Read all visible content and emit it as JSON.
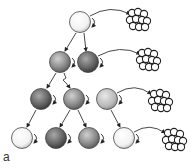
{
  "figure": {
    "panel_label": "a",
    "cells": [
      {
        "id": "c0",
        "cx": 80,
        "cy": 22,
        "shade": "white"
      },
      {
        "id": "c1",
        "cx": 60,
        "cy": 62,
        "shade": "gray"
      },
      {
        "id": "c2",
        "cx": 88,
        "cy": 62,
        "shade": "dark"
      },
      {
        "id": "c3",
        "cx": 41,
        "cy": 99,
        "shade": "dark"
      },
      {
        "id": "c4",
        "cx": 74,
        "cy": 99,
        "shade": "gray"
      },
      {
        "id": "c5",
        "cx": 107,
        "cy": 99,
        "shade": "light"
      },
      {
        "id": "c6",
        "cx": 22,
        "cy": 138,
        "shade": "white"
      },
      {
        "id": "c7",
        "cx": 56,
        "cy": 138,
        "shade": "dark"
      },
      {
        "id": "c8",
        "cx": 89,
        "cy": 138,
        "shade": "gray"
      },
      {
        "id": "c9",
        "cx": 124,
        "cy": 138,
        "shade": "white"
      }
    ],
    "colonies": [
      {
        "cx": 138,
        "cy": 20
      },
      {
        "cx": 148,
        "cy": 60
      },
      {
        "cx": 160,
        "cy": 101
      },
      {
        "cx": 174,
        "cy": 140
      }
    ]
  }
}
